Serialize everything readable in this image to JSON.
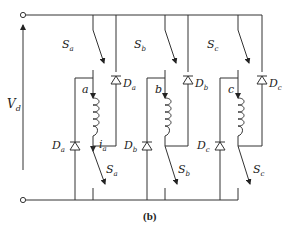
{
  "diagram": {
    "type": "circuit",
    "caption": "(b)",
    "source_label": {
      "main": "V",
      "sub": "d"
    },
    "colors": {
      "wire": "#333333",
      "background": "#ffffff"
    },
    "phases": [
      {
        "name": "a",
        "upper_switch": {
          "main": "S",
          "sub": "a"
        },
        "lower_switch": {
          "main": "S",
          "sub": "a"
        },
        "upper_diode": {
          "main": "D",
          "sub": "a"
        },
        "lower_diode": {
          "main": "D",
          "sub": "a"
        },
        "node": "a",
        "current": {
          "main": "i",
          "sub": "a"
        }
      },
      {
        "name": "b",
        "upper_switch": {
          "main": "S",
          "sub": "b"
        },
        "lower_switch": {
          "main": "S",
          "sub": "b"
        },
        "upper_diode": {
          "main": "D",
          "sub": "b"
        },
        "lower_diode": {
          "main": "D",
          "sub": "b"
        },
        "node": "b"
      },
      {
        "name": "c",
        "upper_switch": {
          "main": "S",
          "sub": "c"
        },
        "lower_switch": {
          "main": "S",
          "sub": "c"
        },
        "upper_diode": {
          "main": "D",
          "sub": "c"
        },
        "lower_diode": {
          "main": "D",
          "sub": "c"
        },
        "node": "c"
      }
    ]
  }
}
